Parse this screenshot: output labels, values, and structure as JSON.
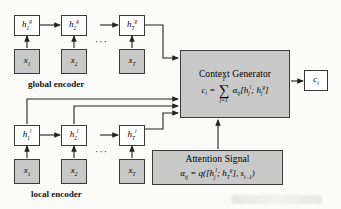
{
  "figure": {
    "type": "architecture-diagram"
  },
  "global_encoder": {
    "label": "global encoder",
    "hidden_states": [
      {
        "base": "h",
        "sub": "1",
        "sup": "g"
      },
      {
        "base": "h",
        "sub": "2",
        "sup": "g"
      },
      {
        "base": "h",
        "sub": "T",
        "sup": "g"
      }
    ],
    "inputs": [
      {
        "base": "x",
        "sub": "1"
      },
      {
        "base": "x",
        "sub": "2"
      },
      {
        "base": "x",
        "sub": "T"
      }
    ],
    "ellipsis": "···"
  },
  "local_encoder": {
    "label": "local encoder",
    "hidden_states": [
      {
        "base": "h",
        "sub": "1",
        "sup": "l"
      },
      {
        "base": "h",
        "sub": "2",
        "sup": "l"
      },
      {
        "base": "h",
        "sub": "T",
        "sup": "l"
      }
    ],
    "inputs": [
      {
        "base": "x",
        "sub": "1"
      },
      {
        "base": "x",
        "sub": "2"
      },
      {
        "base": "x",
        "sub": "T"
      }
    ],
    "ellipsis": "···"
  },
  "context_generator": {
    "title": "Context Generator",
    "formula_lhs": "c",
    "formula_lhs_sub": "t",
    "sum_upper": "T",
    "sum_lower": "j=1",
    "alpha": "α",
    "alpha_sub": "tj",
    "bracket_open": "[",
    "term1_base": "h",
    "term1_sub": "j",
    "term1_sup": "l",
    "separator": ";",
    "term2_base": "h",
    "term2_sub": "j",
    "term2_sup": "g",
    "bracket_close": "]",
    "equals": "=",
    "fill_color": "#c9c9c9"
  },
  "attention_signal": {
    "title": "Attention Signal",
    "alpha": "α",
    "alpha_sub": "tj",
    "equals": "=",
    "q": "q",
    "paren_open": "(",
    "bracket_open": "[",
    "term1_base": "h",
    "term1_sub": "j",
    "term1_sup": "l",
    "separator": ";",
    "term2_base": "h",
    "term2_sub": "T",
    "term2_sup": "g",
    "bracket_close": "]",
    "comma": ",",
    "state_base": "s",
    "state_sub": "t−1",
    "paren_close": ")",
    "fill_color": "#c9c9c9"
  },
  "output": {
    "base": "c",
    "sub": "t"
  },
  "colors": {
    "box_fill_gray": "#c9c9c9",
    "box_fill_white": "#ffffff",
    "stroke": "#3a3a3a",
    "background": "#fbfbf9"
  }
}
